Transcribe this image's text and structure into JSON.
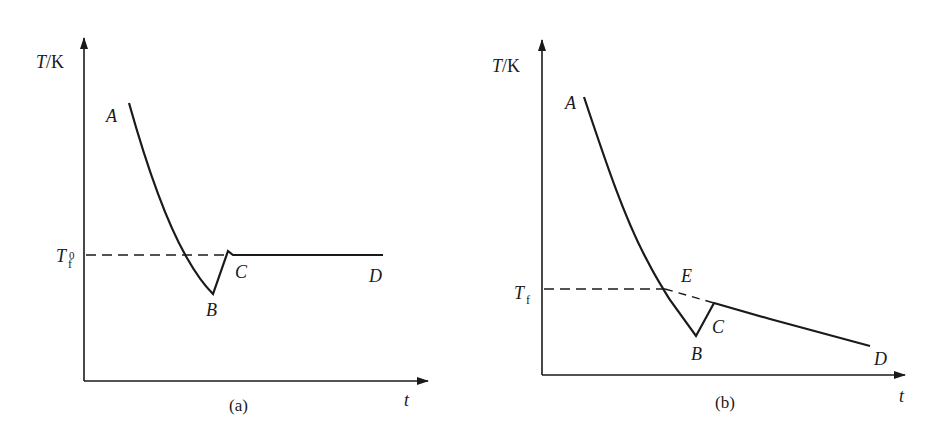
{
  "panels": [
    {
      "caption": "(a)",
      "y_axis_label_var": "T",
      "y_axis_label_unit": "/K",
      "x_axis_label": "t",
      "ref_line_label_main": "T",
      "ref_line_label_sub": "f",
      "ref_line_label_sup": "0",
      "points": {
        "A": "A",
        "B": "B",
        "C": "C",
        "D": "D"
      }
    },
    {
      "caption": "(b)",
      "y_axis_label_var": "T",
      "y_axis_label_unit": "/K",
      "x_axis_label": "t",
      "ref_line_label_main": "T",
      "ref_line_label_sub": "f",
      "points": {
        "A": "A",
        "B": "B",
        "C": "C",
        "D": "D",
        "E": "E"
      }
    }
  ],
  "colors": {
    "line": "#1a1a1a",
    "background": "#ffffff"
  }
}
